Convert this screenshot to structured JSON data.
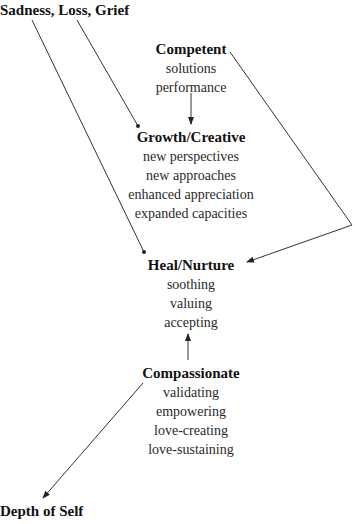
{
  "diagram": {
    "corners": {
      "top_left": "Sadness, Loss, Grief",
      "bottom_left": "Depth of Self"
    },
    "nodes": [
      {
        "id": "competent",
        "title": "Competent",
        "items": [
          "solutions",
          "performance"
        ]
      },
      {
        "id": "growth",
        "title": "Growth/Creative",
        "items": [
          "new perspectives",
          "new approaches",
          "enhanced appreciation",
          "expanded capacities"
        ]
      },
      {
        "id": "heal",
        "title": "Heal/Nurture",
        "items": [
          "soothing",
          "valuing",
          "accepting"
        ]
      },
      {
        "id": "compassionate",
        "title": "Compassionate",
        "items": [
          "validating",
          "empowering",
          "love-creating",
          "love-sustaining"
        ]
      }
    ],
    "edges": [
      {
        "from": "Sadness, Loss, Grief",
        "to": "Growth/Creative"
      },
      {
        "from": "Sadness, Loss, Grief",
        "to": "Heal/Nurture"
      },
      {
        "from": "Competent",
        "to": "Growth/Creative"
      },
      {
        "from": "Competent",
        "to": "Heal/Nurture"
      },
      {
        "from": "Compassionate",
        "to": "Heal/Nurture"
      },
      {
        "from": "Compassionate",
        "to": "Depth of Self"
      }
    ],
    "line_color": "#333333"
  }
}
